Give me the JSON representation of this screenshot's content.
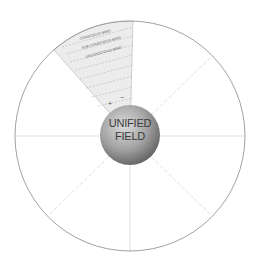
{
  "diagram": {
    "center_label_line1": "UNIFIED",
    "center_label_line2": "FIELD",
    "wedge": {
      "levels": [
        "CONSCIOUS MIND",
        "SUB-CONSCIOUS MIND",
        "UNCONSCIOUS MIND"
      ],
      "plus_symbol": "+",
      "minus_symbol": "−"
    },
    "colors": {
      "circle_stroke": "#8a8a8a",
      "wedge_fill": "#ececec",
      "divider_line": "#c8c8c8",
      "sphere_light": "#d6d6d6",
      "sphere_dark": "#6f6f6f",
      "label_text": "#3a3a3a"
    }
  }
}
